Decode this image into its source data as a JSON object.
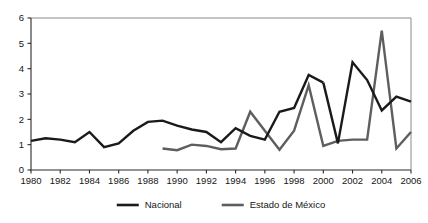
{
  "chart_data": {
    "type": "line",
    "title": "",
    "subtitle": "",
    "xlabel": "",
    "ylabel": "",
    "xlim": [
      1980,
      2006
    ],
    "ylim": [
      0,
      6
    ],
    "grid": false,
    "legend_position": "bottom",
    "x_ticks": [
      "1980",
      "1982",
      "1984",
      "1986",
      "1988",
      "1990",
      "1992",
      "1994",
      "1996",
      "1998",
      "2000",
      "2002",
      "2004",
      "2006"
    ],
    "x_tick_values": [
      1980,
      1982,
      1984,
      1986,
      1988,
      1990,
      1992,
      1994,
      1996,
      1998,
      2000,
      2002,
      2004,
      2006
    ],
    "y_ticks": [
      "0",
      "1",
      "2",
      "3",
      "4",
      "5",
      "6"
    ],
    "y_tick_values": [
      0,
      1,
      2,
      3,
      4,
      5,
      6
    ],
    "series": [
      {
        "name": "Nacional",
        "color": "#1a1a1a",
        "width": 2.4,
        "x": [
          1980,
          1981,
          1982,
          1983,
          1984,
          1985,
          1986,
          1987,
          1988,
          1989,
          1990,
          1991,
          1992,
          1993,
          1994,
          1995,
          1996,
          1997,
          1998,
          1999,
          2000,
          2001,
          2002,
          2003,
          2004,
          2005,
          2006
        ],
        "values": [
          1.15,
          1.25,
          1.2,
          1.1,
          1.5,
          0.9,
          1.05,
          1.55,
          1.9,
          1.95,
          1.75,
          1.6,
          1.5,
          1.1,
          1.65,
          1.35,
          1.2,
          2.3,
          2.45,
          3.75,
          3.45,
          3.2,
          3.1,
          3.05,
          3.1,
          4.9,
          3.5
        ]
      },
      {
        "name": "Estado de México",
        "color": "#5e5e5e",
        "width": 2.4,
        "x": [
          1989,
          1990,
          1991,
          1992,
          1993,
          1994,
          1995,
          1996,
          1997,
          1998,
          1999,
          2000,
          2001,
          2002,
          2003,
          2004,
          2005,
          2006
        ],
        "values": [
          0.85,
          0.78,
          1.0,
          0.95,
          0.82,
          0.85,
          2.3,
          1.55,
          0.8,
          1.55,
          3.35,
          0.95,
          1.15,
          1.2,
          1.2,
          5.5,
          0.85,
          1.5
        ]
      }
    ],
    "series_nacional_tail": {
      "x": [
        2000,
        2001,
        2002,
        2003,
        2004,
        2005,
        2006
      ],
      "values": [
        3.45,
        1.05,
        4.25,
        3.55,
        2.35,
        2.9,
        2.7
      ]
    },
    "legend": [
      {
        "label": "Nacional",
        "color": "#1a1a1a"
      },
      {
        "label": "Estado de México",
        "color": "#5e5e5e"
      }
    ]
  }
}
